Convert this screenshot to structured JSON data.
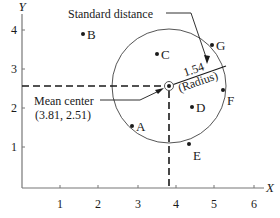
{
  "diagram": {
    "type": "standard-distance-scatter",
    "axes": {
      "x_title": "X",
      "y_title": "Y",
      "x_ticks": [
        "1",
        "2",
        "3",
        "4",
        "5",
        "6"
      ],
      "y_ticks": [
        "1",
        "2",
        "3",
        "4"
      ]
    },
    "points": [
      {
        "label": "A"
      },
      {
        "label": "B"
      },
      {
        "label": "C"
      },
      {
        "label": "D"
      },
      {
        "label": "E"
      },
      {
        "label": "F"
      },
      {
        "label": "G"
      }
    ],
    "mean_center": {
      "label": "Mean center",
      "coords": "(3.81, 2.51)"
    },
    "standard_distance": {
      "label": "Standard distance",
      "value": "1.54",
      "unit_label": "(Radius)"
    },
    "colors": {
      "line": "#1a1a1a",
      "circle": "#555555",
      "axis": "#777777"
    }
  }
}
